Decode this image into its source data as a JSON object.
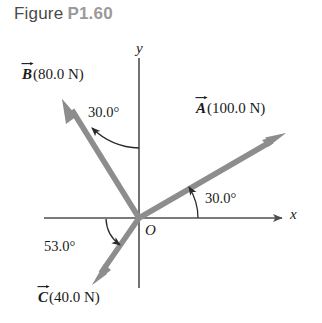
{
  "caption": {
    "prefix": "Figure",
    "number": "P1.60"
  },
  "axes": {
    "x_label": "x",
    "y_label": "y",
    "origin_label": "O"
  },
  "colors": {
    "vector": "#8d8d8d",
    "axis": "#4f4f4f",
    "text": "#1a1a1a",
    "caption_label": "#4a4a4a",
    "caption_number": "#9a9a9a",
    "background": "#ffffff"
  },
  "vectors": [
    {
      "id": "A",
      "symbol": "A",
      "magnitude": "(100.0 N)",
      "label_text": "A (100.0 N)",
      "angle_text": "30.0°",
      "angle_deg": 30.0,
      "magnitude_value": 100.0,
      "unit": "N",
      "reference": "+x axis",
      "direction": "upper-right"
    },
    {
      "id": "B",
      "symbol": "B",
      "magnitude": "(80.0 N)",
      "label_text": "B (80.0 N)",
      "angle_text": "30.0°",
      "angle_deg": 30.0,
      "magnitude_value": 80.0,
      "unit": "N",
      "reference": "+y axis",
      "direction": "upper-left"
    },
    {
      "id": "C",
      "symbol": "C",
      "magnitude": "(40.0 N)",
      "label_text": "C (40.0 N)",
      "angle_text": "53.0°",
      "angle_deg": 53.0,
      "magnitude_value": 40.0,
      "unit": "N",
      "reference": "-x axis",
      "direction": "lower-left"
    }
  ]
}
